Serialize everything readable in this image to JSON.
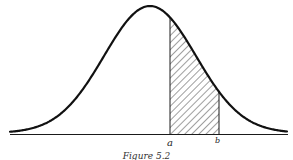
{
  "figure": {
    "type": "normal-distribution-curve",
    "labels": {
      "a": "a",
      "b": "b"
    },
    "shaded_region": "area under curve between a and b",
    "caption": "Figure 5.2"
  },
  "chart_data": {
    "type": "area",
    "title": "",
    "curve": "normal",
    "tick_labels": [
      "a",
      "b"
    ],
    "shaded_interval": [
      "a",
      "b"
    ],
    "grid": false,
    "xlabel": "",
    "ylabel": ""
  },
  "colors": {
    "ink": "#1a1a1a",
    "background": "#ffffff"
  }
}
